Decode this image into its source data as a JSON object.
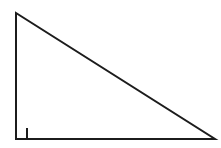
{
  "figure": {
    "name": "right-triangle",
    "title": "Right triangle diagram",
    "canvas": {
      "width": 221,
      "height": 148,
      "background_color": "#FFFFFF"
    },
    "stroke": {
      "color": "#1C1C1C",
      "width": 2,
      "linejoin": "miter",
      "linecap": "butt"
    },
    "fill_color": "none",
    "vertices": {
      "top": {
        "label": "top-vertex",
        "x": 16,
        "y": 13
      },
      "bottom_left": {
        "label": "bottom-left-vertex",
        "x": 16,
        "y": 139
      },
      "bottom_right": {
        "label": "bottom-right-vertex",
        "x": 215,
        "y": 139
      }
    },
    "polygon_points": "16,13 16,139 215,139",
    "edges": [
      {
        "name": "vertical-leg",
        "from": "top",
        "to": "bottom_left",
        "length_px": 126,
        "orientation": "vertical"
      },
      {
        "name": "horizontal-leg",
        "from": "bottom_left",
        "to": "bottom_right",
        "length_px": 199,
        "orientation": "horizontal"
      },
      {
        "name": "hypotenuse",
        "from": "top",
        "to": "bottom_right",
        "length_px": 235,
        "orientation": "diagonal"
      }
    ],
    "right_angle_marker": {
      "name": "right-angle-square",
      "at_vertex": "bottom_left",
      "x": 16,
      "y": 128,
      "size": 11,
      "points": "27,128 27,139 16,139",
      "stroke_width": 2,
      "stroke_color": "#1C1C1C"
    },
    "labels": []
  }
}
